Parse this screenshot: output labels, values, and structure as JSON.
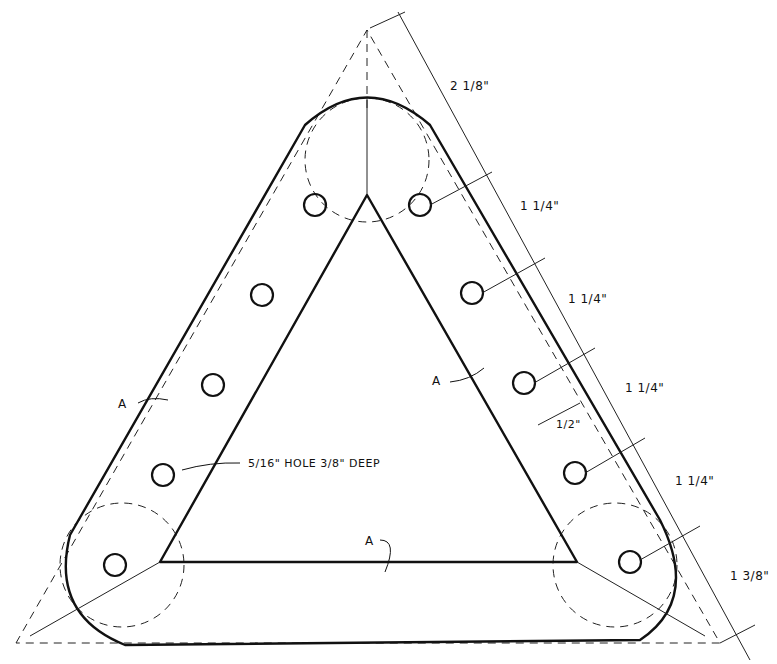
{
  "diagram": {
    "type": "technical-drawing",
    "part_labels": [
      "A",
      "A",
      "A"
    ],
    "hole_callout": "5/16\" HOLE  3/8\" DEEP",
    "dimensions": [
      {
        "id": "apex-to-first-hole",
        "label": "2 1/8\""
      },
      {
        "id": "spacing-1",
        "label": "1 1/4\""
      },
      {
        "id": "spacing-2",
        "label": "1 1/4\""
      },
      {
        "id": "spacing-3",
        "label": "1 1/4\""
      },
      {
        "id": "spacing-4",
        "label": "1 1/4\""
      },
      {
        "id": "last-hole-to-corner",
        "label": "1 3/8\""
      },
      {
        "id": "edge-offset",
        "label": "1/2\""
      }
    ],
    "holes_per_side": 5,
    "colors": {
      "ink": "#111111",
      "paper": "#ffffff"
    }
  }
}
